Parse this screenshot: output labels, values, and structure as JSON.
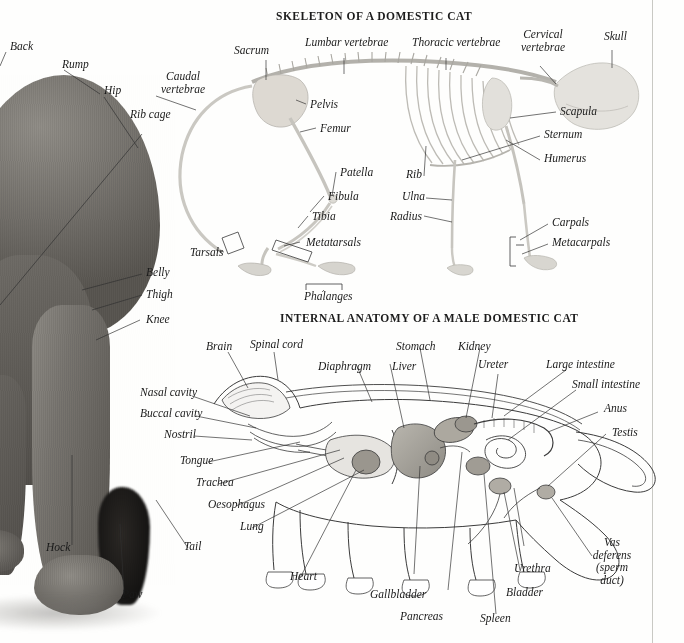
{
  "page": {
    "background_color": "#fefefd",
    "rule_color": "#c9c9c4",
    "ink_color": "#1a1a1a"
  },
  "sections": [
    {
      "id": "skeleton",
      "title": "SKELETON OF A DOMESTIC CAT"
    },
    {
      "id": "internal",
      "title": "INTERNAL ANATOMY OF A MALE DOMESTIC CAT"
    }
  ],
  "photo_labels": [
    {
      "id": "back",
      "text": "Back"
    },
    {
      "id": "rump",
      "text": "Rump"
    },
    {
      "id": "hip",
      "text": "Hip"
    },
    {
      "id": "rib-cage",
      "text": "Rib cage"
    },
    {
      "id": "belly",
      "text": "Belly"
    },
    {
      "id": "thigh",
      "text": "Thigh"
    },
    {
      "id": "knee",
      "text": "Knee"
    },
    {
      "id": "hock",
      "text": "Hock"
    },
    {
      "id": "tail",
      "text": "Tail"
    },
    {
      "id": "paw",
      "text": "Paw"
    }
  ],
  "skeleton_labels": [
    {
      "id": "caudal-vertebrae",
      "line1": "Caudal",
      "line2": "vertebrae"
    },
    {
      "id": "sacrum",
      "text": "Sacrum"
    },
    {
      "id": "lumbar-vertebrae",
      "text": "Lumbar vertebrae"
    },
    {
      "id": "thoracic-vertebrae",
      "text": "Thoracic vertebrae"
    },
    {
      "id": "cervical-vertebrae",
      "line1": "Cervical",
      "line2": "vertebrae"
    },
    {
      "id": "skull",
      "text": "Skull"
    },
    {
      "id": "pelvis",
      "text": "Pelvis"
    },
    {
      "id": "femur",
      "text": "Femur"
    },
    {
      "id": "patella",
      "text": "Patella"
    },
    {
      "id": "fibula",
      "text": "Fibula"
    },
    {
      "id": "tibia",
      "text": "Tibia"
    },
    {
      "id": "tarsals",
      "text": "Tarsals"
    },
    {
      "id": "metatarsals",
      "text": "Metatarsals"
    },
    {
      "id": "phalanges",
      "text": "Phalanges"
    },
    {
      "id": "rib",
      "text": "Rib"
    },
    {
      "id": "ulna",
      "text": "Ulna"
    },
    {
      "id": "radius",
      "text": "Radius"
    },
    {
      "id": "scapula",
      "text": "Scapula"
    },
    {
      "id": "sternum",
      "text": "Sternum"
    },
    {
      "id": "humerus",
      "text": "Humerus"
    },
    {
      "id": "carpals",
      "text": "Carpals"
    },
    {
      "id": "metacarpals",
      "text": "Metacarpals"
    }
  ],
  "internal_labels": [
    {
      "id": "brain",
      "text": "Brain"
    },
    {
      "id": "spinal-cord",
      "text": "Spinal cord"
    },
    {
      "id": "stomach",
      "text": "Stomach"
    },
    {
      "id": "kidney",
      "text": "Kidney"
    },
    {
      "id": "diaphragm",
      "text": "Diaphragm"
    },
    {
      "id": "liver",
      "text": "Liver"
    },
    {
      "id": "ureter",
      "text": "Ureter"
    },
    {
      "id": "large-intestine",
      "text": "Large intestine"
    },
    {
      "id": "small-intestine",
      "text": "Small intestine"
    },
    {
      "id": "anus",
      "text": "Anus"
    },
    {
      "id": "testis",
      "text": "Testis"
    },
    {
      "id": "nasal-cavity",
      "text": "Nasal cavity"
    },
    {
      "id": "buccal-cavity",
      "text": "Buccal cavity"
    },
    {
      "id": "nostril",
      "text": "Nostril"
    },
    {
      "id": "tongue",
      "text": "Tongue"
    },
    {
      "id": "trachea",
      "text": "Trachea"
    },
    {
      "id": "oesophagus",
      "text": "Oesophagus"
    },
    {
      "id": "lung",
      "text": "Lung"
    },
    {
      "id": "heart",
      "text": "Heart"
    },
    {
      "id": "gallbladder",
      "text": "Gallbladder"
    },
    {
      "id": "pancreas",
      "text": "Pancreas"
    },
    {
      "id": "spleen",
      "text": "Spleen"
    },
    {
      "id": "bladder",
      "text": "Bladder"
    },
    {
      "id": "urethra",
      "text": "Urethra"
    },
    {
      "id": "vas-deferens",
      "line1": "Vas",
      "line2": "deferens",
      "line3": "(sperm",
      "line4": "duct)"
    }
  ]
}
